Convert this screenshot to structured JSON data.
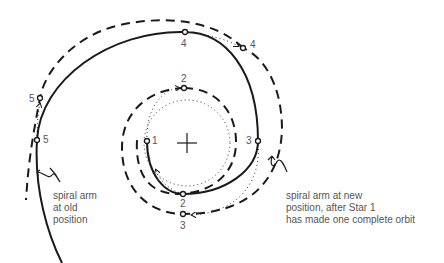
{
  "diagram": {
    "type": "spiral-arm-rotation",
    "colors": {
      "ink": "#1a1a1a",
      "label": "#555555",
      "background": "#ffffff"
    },
    "center": {
      "symbol": "cross",
      "x": 187,
      "y": 143
    },
    "old_arm": {
      "style": "solid",
      "stars": [
        {
          "label": "1",
          "x": 147,
          "y": 141
        },
        {
          "label": "2",
          "x": 183,
          "y": 194
        },
        {
          "label": "3",
          "x": 258,
          "y": 141
        },
        {
          "label": "4",
          "x": 185,
          "y": 32
        },
        {
          "label": "5",
          "x": 37,
          "y": 140
        }
      ]
    },
    "new_arm": {
      "style": "dashed",
      "stars": [
        {
          "label": "2",
          "x": 184,
          "y": 88
        },
        {
          "label": "3",
          "x": 183,
          "y": 214
        },
        {
          "label": "4",
          "x": 243,
          "y": 48
        },
        {
          "label": "5",
          "x": 40,
          "y": 98
        }
      ]
    },
    "labels": {
      "star1": "1",
      "star2_old": "2",
      "star2_new": "2",
      "star3_old": "3",
      "star3_new": "3",
      "star4_old": "4",
      "star4_new": "4",
      "star5_old": "5",
      "star5_new": "5"
    },
    "captions": {
      "old_line1": "spiral arm",
      "old_line2": "at old",
      "old_line3": "position",
      "new_line1": "spiral arm at new",
      "new_line2": "position, after Star 1",
      "new_line3": "has made one complete orbit"
    }
  }
}
